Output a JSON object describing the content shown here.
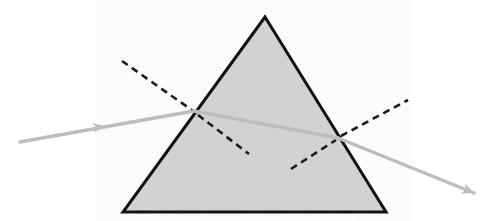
{
  "figure": {
    "type": "optics-ray-diagram",
    "canvas": {
      "width": 496,
      "height": 221,
      "background": "#ffffff"
    }
  },
  "colors": {
    "prism_fill": "#d2d2d2",
    "prism_outline": "#111111",
    "ray": "#bdbdbd",
    "normal_dash": "#1a1a1a",
    "background": "#ffffff"
  },
  "prism": {
    "name": "triangular-prism",
    "shape": "triangle",
    "apex": {
      "x": 265,
      "y": 17
    },
    "bottom_left": {
      "x": 123,
      "y": 212
    },
    "bottom_right": {
      "x": 386,
      "y": 212
    },
    "points": "265,17 386,212 123,212",
    "fill": "#d2d2d2",
    "stroke": "#111111",
    "stroke_width": 3
  },
  "rays": {
    "stroke": "#bdbdbd",
    "stroke_width": 3.4,
    "incident": {
      "label": "incident-ray",
      "from": {
        "x": 20,
        "y": 142
      },
      "to": {
        "x": 194,
        "y": 111
      },
      "arrow_tip": {
        "x": 104,
        "y": 126
      },
      "arrow_size": 11
    },
    "internal": {
      "label": "refracted-ray-inside-prism",
      "from": {
        "x": 194,
        "y": 111
      },
      "to": {
        "x": 338,
        "y": 138
      }
    },
    "emergent": {
      "label": "emergent-ray",
      "from": {
        "x": 338,
        "y": 138
      },
      "to": {
        "x": 474,
        "y": 193
      },
      "arrow_tip": {
        "x": 474,
        "y": 193
      },
      "arrow_size": 12
    }
  },
  "normals": {
    "stroke": "#1a1a1a",
    "stroke_width": 2.6,
    "dash_pattern": "7,5",
    "entry_outer": {
      "label": "normal-at-entry-outside",
      "from": {
        "x": 122,
        "y": 61
      },
      "to": {
        "x": 196,
        "y": 113
      }
    },
    "entry_inner": {
      "label": "normal-at-entry-inside",
      "from": {
        "x": 198,
        "y": 115
      },
      "to": {
        "x": 249,
        "y": 154
      }
    },
    "exit_inner": {
      "label": "normal-at-exit-inside",
      "from": {
        "x": 291,
        "y": 169
      },
      "to": {
        "x": 336,
        "y": 140
      }
    },
    "exit_outer": {
      "label": "normal-at-exit-outside",
      "from": {
        "x": 341,
        "y": 136
      },
      "to": {
        "x": 408,
        "y": 100
      }
    }
  },
  "points_of_interest": {
    "entry_point": {
      "label": "point-of-incidence",
      "x": 194,
      "y": 111
    },
    "exit_point": {
      "label": "point-of-emergence",
      "x": 338,
      "y": 138
    }
  }
}
